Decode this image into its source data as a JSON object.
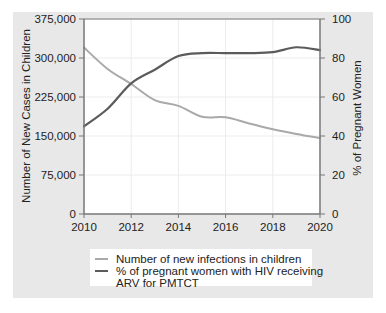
{
  "chart_data": {
    "type": "line",
    "title": "",
    "xlabel": "",
    "ylabel": "Number of New Cases in Children",
    "y2label": "% of Pregnant Women",
    "x": [
      2010,
      2011,
      2012,
      2013,
      2014,
      2015,
      2016,
      2017,
      2018,
      2019,
      2020
    ],
    "xlim": [
      2010,
      2020
    ],
    "xticks": [
      "2010",
      "2012",
      "2014",
      "2016",
      "2018",
      "2020"
    ],
    "xtick_values": [
      2010,
      2012,
      2014,
      2016,
      2018,
      2020
    ],
    "ylim": [
      0,
      375000
    ],
    "yticks": [
      "0",
      "75,000",
      "150,000",
      "225,000",
      "300,000",
      "375,000"
    ],
    "ytick_values": [
      0,
      75000,
      150000,
      225000,
      300000,
      375000
    ],
    "y2lim": [
      0,
      100
    ],
    "y2ticks": [
      "0",
      "20",
      "40",
      "60",
      "80",
      "100"
    ],
    "y2tick_values": [
      0,
      20,
      40,
      60,
      80,
      100
    ],
    "grid": true,
    "legend_position": "bottom",
    "series": [
      {
        "name": "Number of new infections in children",
        "axis": "left",
        "color": "#a9a9a9",
        "values": [
          320000,
          279000,
          250000,
          219000,
          208000,
          187000,
          186000,
          174000,
          163000,
          154000,
          146000
        ]
      },
      {
        "name": "% of pregnant women with HIV receiving ARV for PMTCT",
        "axis": "right",
        "color": "#5b5b5b",
        "values": [
          45,
          54,
          67,
          74,
          81,
          82.5,
          82.5,
          82.5,
          83,
          85.5,
          84
        ]
      }
    ]
  },
  "legend": {
    "items": [
      {
        "lines": [
          "Number of new infections in children"
        ],
        "color": "#a9a9a9"
      },
      {
        "lines": [
          "% of pregnant women with HIV receiving",
          "ARV for PMTCT"
        ],
        "color": "#5b5b5b"
      }
    ]
  }
}
